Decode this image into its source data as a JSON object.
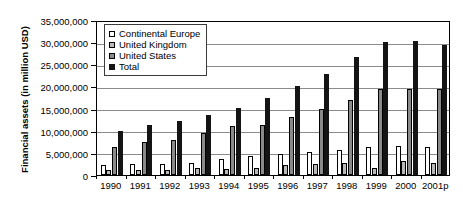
{
  "chart_data": {
    "type": "bar",
    "title": "",
    "xlabel": "",
    "ylabel": "Financial assets (in million USD)",
    "ylim": [
      0,
      35000000
    ],
    "ytick_values": [
      0,
      5000000,
      10000000,
      15000000,
      20000000,
      25000000,
      30000000,
      35000000
    ],
    "ytick_labels": [
      "0",
      "5,000,000",
      "10,000,000",
      "15,000,000",
      "20,000,000",
      "25,000,000",
      "30,000,000",
      "35,000,000"
    ],
    "grid": true,
    "legend_position": "upper-left-inside",
    "categories": [
      "1990",
      "1991",
      "1992",
      "1993",
      "1994",
      "1995",
      "1996",
      "1997",
      "1998",
      "1999",
      "2000",
      "2001p"
    ],
    "series": [
      {
        "name": "Continental Europe",
        "color": "#ffffff",
        "values": [
          2200000,
          2400000,
          2500000,
          2700000,
          3700000,
          4300000,
          4700000,
          5200000,
          5700000,
          6400000,
          6500000,
          6400000
        ]
      },
      {
        "name": "United Kingdom",
        "color": "#b9b9b9",
        "values": [
          1100000,
          1200000,
          1100000,
          1500000,
          1400000,
          1600000,
          2200000,
          2500000,
          2700000,
          1500000,
          3100000,
          2700000
        ]
      },
      {
        "name": "United States",
        "color": "#8a8a8a",
        "values": [
          6400000,
          7500000,
          8000000,
          9400000,
          11000000,
          11400000,
          13200000,
          15000000,
          17000000,
          19500000,
          19500000,
          19400000
        ]
      },
      {
        "name": "Total",
        "color": "#141414",
        "values": [
          10000000,
          11300000,
          12200000,
          13600000,
          15100000,
          17400000,
          20000000,
          22700000,
          26700000,
          30000000,
          30200000,
          29400000
        ]
      }
    ]
  },
  "legend": {
    "items": [
      {
        "label": "Continental Europe",
        "swatch": "legend-swatch-continental-europe"
      },
      {
        "label": "United Kingdom",
        "swatch": "legend-swatch-united-kingdom"
      },
      {
        "label": "United States",
        "swatch": "legend-swatch-united-states"
      },
      {
        "label": "Total",
        "swatch": "legend-swatch-total"
      }
    ]
  }
}
